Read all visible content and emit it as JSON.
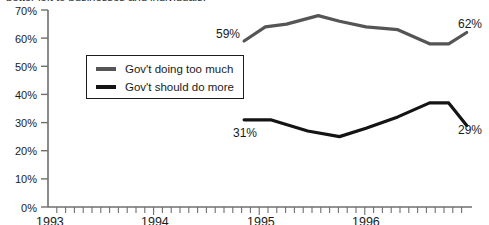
{
  "headline": "better left to businesses and individuals.",
  "legend": {
    "position": "inside-upper-left",
    "entries": [
      {
        "label": "Gov't doing too much",
        "color": "#555555"
      },
      {
        "label": "Gov't should do more",
        "color": "#141414"
      }
    ]
  },
  "axis": {
    "y_ticks": [
      "0%",
      "10%",
      "20%",
      "30%",
      "40%",
      "50%",
      "60%",
      "70%"
    ],
    "x_ticks": [
      "1993",
      "1994",
      "1995",
      "1996"
    ]
  },
  "annotations": {
    "gray_start": "59%",
    "gray_end": "62%",
    "black_start": "31%",
    "black_end": "29%"
  },
  "chart_data": {
    "type": "line",
    "title": "better left to businesses and individuals.",
    "xlabel": "",
    "ylabel": "",
    "ylim": [
      0,
      70
    ],
    "ytick_step": 10,
    "xlim": [
      1993.0,
      1997.0
    ],
    "xtick_labels": [
      "1993",
      "1994",
      "1995",
      "1996"
    ],
    "minor_ticks": "monthly",
    "grid": false,
    "legend_position": "inside-upper-left",
    "series": [
      {
        "name": "Gov't doing too much",
        "color": "#555555",
        "x": [
          1994.85,
          1995.05,
          1995.25,
          1995.55,
          1995.75,
          1996.0,
          1996.3,
          1996.6,
          1996.78,
          1996.95
        ],
        "values": [
          59,
          64,
          65,
          68,
          66,
          64,
          63,
          58,
          58,
          62
        ],
        "labels": {
          "start": "59%",
          "end": "62%"
        }
      },
      {
        "name": "Gov't should do more",
        "color": "#141414",
        "x": [
          1994.85,
          1995.1,
          1995.45,
          1995.75,
          1996.0,
          1996.3,
          1996.6,
          1996.78,
          1996.95
        ],
        "values": [
          31,
          31,
          27,
          25,
          28,
          32,
          37,
          37,
          29
        ],
        "labels": {
          "start": "31%",
          "end": "29%"
        }
      }
    ]
  }
}
